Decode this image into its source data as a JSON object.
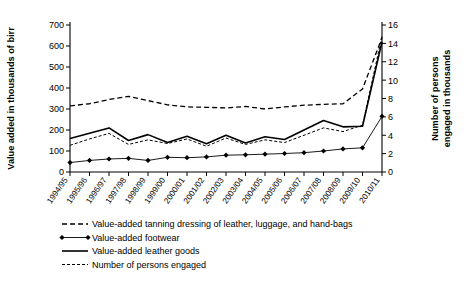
{
  "chart_data": {
    "type": "line",
    "title": "",
    "categories": [
      "1994/95",
      "1995/96",
      "1996/97",
      "1997/98",
      "1998/99",
      "1999/00",
      "2000/01",
      "2001/02",
      "2002/03",
      "2003/04",
      "2004/05",
      "2005/06",
      "2006/07",
      "2007/08",
      "2008/09",
      "2009/10",
      "2010/11"
    ],
    "xlabel": "",
    "ylabel": "Value added in thousands of birr",
    "y2label": "Number of persons engaged in thousands",
    "ylim": [
      0,
      700
    ],
    "yticks": [
      0,
      100,
      200,
      300,
      400,
      500,
      600,
      700
    ],
    "y2lim": [
      0,
      16
    ],
    "y2ticks": [
      0,
      2,
      4,
      6,
      8,
      10,
      12,
      14,
      16
    ],
    "grid": false,
    "legend_position": "below",
    "series": [
      {
        "name": "Value-added tanning dressing of leather, luggage, and hand-bags",
        "axis": "left",
        "style": "dashed",
        "marker": "none",
        "color": "#000000",
        "values": [
          315,
          325,
          345,
          360,
          340,
          320,
          310,
          308,
          305,
          312,
          300,
          310,
          318,
          322,
          325,
          395,
          640
        ]
      },
      {
        "name": "Value-added footwear",
        "axis": "left",
        "style": "solid-thin",
        "marker": "diamond",
        "color": "#000000",
        "values": [
          45,
          55,
          62,
          65,
          55,
          70,
          68,
          72,
          80,
          82,
          85,
          88,
          92,
          100,
          110,
          115,
          265
        ]
      },
      {
        "name": "Value-added leather goods",
        "axis": "left",
        "style": "solid",
        "marker": "none",
        "color": "#000000",
        "values": [
          160,
          185,
          210,
          150,
          178,
          140,
          170,
          135,
          175,
          138,
          168,
          155,
          200,
          245,
          215,
          218,
          620
        ]
      },
      {
        "name": "Number of persons engaged",
        "axis": "right",
        "style": "dashed-fine",
        "color": "#000000",
        "values": [
          2.9,
          3.6,
          4.2,
          3.0,
          3.5,
          3.1,
          3.6,
          2.8,
          3.7,
          3.0,
          3.5,
          3.2,
          4.0,
          4.8,
          4.4,
          5.1,
          14.8
        ]
      }
    ]
  },
  "legend": {
    "items": [
      {
        "label": "Value-added tanning dressing of leather, luggage, and hand-bags",
        "style": "dashed"
      },
      {
        "label": "Value-added footwear",
        "style": "diamond"
      },
      {
        "label": "Value-added leather goods",
        "style": "solid"
      },
      {
        "label": "Number of persons engaged",
        "style": "dotted"
      }
    ]
  }
}
